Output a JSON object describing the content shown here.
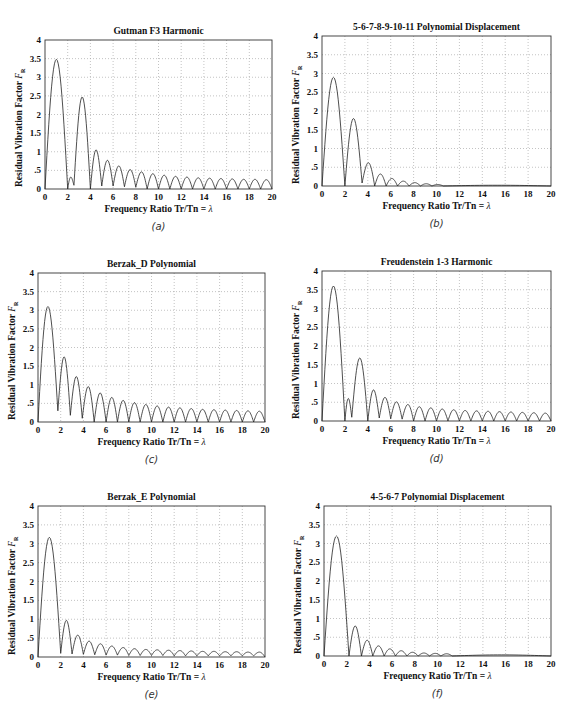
{
  "figure": {
    "panels": [
      {
        "id": "a",
        "caption": "(a)",
        "title": "Gutman F3 Harmonic",
        "box": {
          "left": 45,
          "top": 40,
          "right": 272,
          "bottom": 189
        }
      },
      {
        "id": "b",
        "caption": "(b)",
        "title": "5-6-7-8-9-10-11 Polynomial Displacement",
        "box": {
          "left": 322,
          "top": 36,
          "right": 551,
          "bottom": 186
        }
      },
      {
        "id": "c",
        "caption": "(c)",
        "title": "Berzak_D  Polynomial",
        "box": {
          "left": 38,
          "top": 273,
          "right": 265,
          "bottom": 422
        }
      },
      {
        "id": "d",
        "caption": "(d)",
        "title": "Freudenstein 1-3 Harmonic",
        "box": {
          "left": 322,
          "top": 271,
          "right": 551,
          "bottom": 421
        }
      },
      {
        "id": "e",
        "caption": "(e)",
        "title": "Berzak_E  Polynomial",
        "box": {
          "left": 38,
          "top": 506,
          "right": 265,
          "bottom": 657
        }
      },
      {
        "id": "f",
        "caption": "(f)",
        "title": "4-5-6-7 Polynomial Displacement",
        "box": {
          "left": 324,
          "top": 506,
          "right": 551,
          "bottom": 656
        }
      }
    ],
    "common": {
      "xlabel_text": "Frequency Ratio  Tr/Tn  = ",
      "xlabel_symbol": "λ",
      "ylabel_text": "Residual Vibration Factor  ",
      "ylabel_symbol": "F",
      "ylabel_subscript": "R",
      "x_ticks": [
        "0",
        "2",
        "4",
        "6",
        "8",
        "10",
        "12",
        "14",
        "16",
        "18",
        "20"
      ],
      "y_ticks": [
        "0",
        ".5",
        "1",
        "1.5",
        "2",
        "2.5",
        "3",
        "3.5",
        "4"
      ]
    }
  },
  "chart_data": [
    {
      "type": "line",
      "title": "Gutman F3 Harmonic",
      "xlabel": "Frequency Ratio Tr/Tn = λ",
      "ylabel": "Residual Vibration Factor F_R",
      "xlim": [
        0,
        20
      ],
      "ylim": [
        0,
        4
      ],
      "grid": true,
      "x_ticks": [
        0,
        2,
        4,
        6,
        8,
        10,
        12,
        14,
        16,
        18,
        20
      ],
      "y_ticks": [
        0,
        0.5,
        1,
        1.5,
        2,
        2.5,
        3,
        3.5,
        4
      ],
      "zeros": [
        0,
        2,
        2.55,
        4,
        5.0,
        6.0,
        7.0,
        8.0,
        9.0,
        10.0,
        11.0,
        12.0,
        13.0,
        14.0,
        15.0,
        16.0,
        17.0,
        18.0,
        19.0,
        20.0
      ],
      "lobe_peaks": [
        3.48,
        0.32,
        2.47,
        1.05,
        0.77,
        0.62,
        0.52,
        0.46,
        0.41,
        0.37,
        0.34,
        0.32,
        0.3,
        0.29,
        0.28,
        0.27,
        0.26,
        0.26,
        0.25
      ],
      "minima_nonzero": {
        "2.55": 0.1,
        "5.0": 0.08,
        "6.0": 0.08,
        "7.0": 0.06,
        "8.0": 0.05
      }
    },
    {
      "type": "line",
      "title": "5-6-7-8-9-10-11 Polynomial Displacement",
      "xlabel": "Frequency Ratio Tr/Tn = λ",
      "ylabel": "Residual Vibration Factor F_R",
      "xlim": [
        0,
        20
      ],
      "ylim": [
        0,
        4
      ],
      "grid": true,
      "x_ticks": [
        0,
        2,
        4,
        6,
        8,
        10,
        12,
        14,
        16,
        18,
        20
      ],
      "y_ticks": [
        0,
        0.5,
        1,
        1.5,
        2,
        2.5,
        3,
        3.5,
        4
      ],
      "zeros": [
        0,
        2.0,
        3.5,
        4.6,
        5.6,
        6.6,
        7.6,
        8.6,
        9.6,
        10.6,
        20.0
      ],
      "lobe_peaks": [
        2.9,
        1.8,
        0.62,
        0.32,
        0.2,
        0.13,
        0.09,
        0.06,
        0.04,
        0.02
      ],
      "minima_nonzero": {
        "3.5": 0.08
      }
    },
    {
      "type": "line",
      "title": "Berzak_D Polynomial",
      "xlabel": "Frequency Ratio Tr/Tn = λ",
      "ylabel": "Residual Vibration Factor F_R",
      "xlim": [
        0,
        20
      ],
      "ylim": [
        0,
        4
      ],
      "grid": true,
      "x_ticks": [
        0,
        2,
        4,
        6,
        8,
        10,
        12,
        14,
        16,
        18,
        20
      ],
      "y_ticks": [
        0,
        0.5,
        1,
        1.5,
        2,
        2.5,
        3,
        3.5,
        4
      ],
      "zeros": [
        0,
        1.75,
        2.85,
        3.9,
        4.95,
        6.0,
        7.0,
        8.0,
        9.0,
        10.0,
        11.0,
        12.0,
        13.0,
        14.0,
        15.0,
        16.0,
        17.0,
        18.0,
        19.0,
        20.0
      ],
      "lobe_peaks": [
        3.1,
        1.75,
        1.22,
        0.95,
        0.78,
        0.66,
        0.58,
        0.52,
        0.47,
        0.43,
        0.4,
        0.38,
        0.36,
        0.34,
        0.33,
        0.32,
        0.31,
        0.3,
        0.29
      ],
      "minima_nonzero": {
        "1.75": 0.3,
        "2.85": 0.18,
        "3.9": 0.1
      }
    },
    {
      "type": "line",
      "title": "Freudenstein 1-3 Harmonic",
      "xlabel": "Frequency Ratio Tr/Tn = λ",
      "ylabel": "Residual Vibration Factor F_R",
      "xlim": [
        0,
        20
      ],
      "ylim": [
        0,
        4
      ],
      "grid": true,
      "x_ticks": [
        0,
        2,
        4,
        6,
        8,
        10,
        12,
        14,
        16,
        18,
        20
      ],
      "y_ticks": [
        0,
        0.5,
        1,
        1.5,
        2,
        2.5,
        3,
        3.5,
        4
      ],
      "zeros": [
        0,
        2.0,
        2.6,
        4.0,
        5.0,
        6.0,
        7.0,
        8.0,
        9.0,
        10.0,
        11.0,
        12.0,
        13.0,
        14.0,
        15.0,
        16.0,
        17.0,
        18.0,
        19.0,
        20.0
      ],
      "lobe_peaks": [
        3.6,
        0.6,
        1.68,
        0.83,
        0.63,
        0.51,
        0.44,
        0.38,
        0.35,
        0.32,
        0.3,
        0.28,
        0.27,
        0.26,
        0.25,
        0.24,
        0.23,
        0.22,
        0.21
      ],
      "minima_nonzero": {
        "2.6": 0.1,
        "5.0": 0.08,
        "6.0": 0.06,
        "7.0": 0.05
      }
    },
    {
      "type": "line",
      "title": "Berzak_E Polynomial",
      "xlabel": "Frequency Ratio Tr/Tn = λ",
      "ylabel": "Residual Vibration Factor F_R",
      "xlim": [
        0,
        20
      ],
      "ylim": [
        0,
        4
      ],
      "grid": true,
      "x_ticks": [
        0,
        2,
        4,
        6,
        8,
        10,
        12,
        14,
        16,
        18,
        20
      ],
      "y_ticks": [
        0,
        0.5,
        1,
        1.5,
        2,
        2.5,
        3,
        3.5,
        4
      ],
      "zeros": [
        0,
        2.0,
        3.0,
        4.0,
        5.0,
        6.0,
        7.0,
        8.0,
        9.0,
        10.0,
        11.0,
        12.0,
        13.0,
        14.0,
        15.0,
        16.0,
        17.0,
        18.0,
        19.0,
        20.0
      ],
      "lobe_peaks": [
        3.17,
        0.97,
        0.58,
        0.42,
        0.35,
        0.29,
        0.25,
        0.22,
        0.2,
        0.19,
        0.18,
        0.17,
        0.16,
        0.15,
        0.15,
        0.14,
        0.14,
        0.13,
        0.13
      ],
      "minima_nonzero": {
        "2.0": 0.1,
        "3.0": 0.08,
        "4.0": 0.07,
        "5.0": 0.06,
        "6.0": 0.05,
        "7.0": 0.05,
        "8.0": 0.04,
        "9.0": 0.04,
        "10.0": 0.04,
        "11.0": 0.04,
        "12.0": 0.03,
        "13.0": 0.03,
        "14.0": 0.03,
        "15.0": 0.03,
        "16.0": 0.03,
        "17.0": 0.03,
        "18.0": 0.03,
        "19.0": 0.03
      }
    },
    {
      "type": "line",
      "title": "4-5-6-7 Polynomial Displacement",
      "xlabel": "Frequency Ratio Tr/Tn = λ",
      "ylabel": "Residual Vibration Factor F_R",
      "xlim": [
        0,
        20
      ],
      "ylim": [
        0,
        4
      ],
      "grid": true,
      "x_ticks": [
        0,
        2,
        4,
        6,
        8,
        10,
        12,
        14,
        16,
        18,
        20
      ],
      "y_ticks": [
        0,
        0.5,
        1,
        1.5,
        2,
        2.5,
        3,
        3.5,
        4
      ],
      "zeros": [
        0,
        2.2,
        3.3,
        4.3,
        5.3,
        6.3,
        7.3,
        8.3,
        9.3,
        10.3,
        11.3,
        20.0
      ],
      "lobe_peaks": [
        3.2,
        0.8,
        0.42,
        0.27,
        0.19,
        0.14,
        0.1,
        0.08,
        0.07,
        0.06,
        0.03
      ],
      "minima_nonzero": {}
    }
  ]
}
